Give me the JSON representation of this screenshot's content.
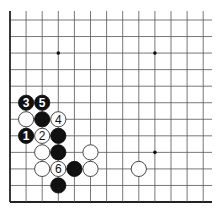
{
  "diagram": {
    "type": "go-board-fragment",
    "columns": 13,
    "rows": 12,
    "edges": [
      "left",
      "bottom"
    ],
    "star_points": [
      {
        "col": 3,
        "row": 2
      },
      {
        "col": 9,
        "row": 2
      },
      {
        "col": 9,
        "row": 8
      }
    ],
    "stones": [
      {
        "col": 1,
        "row": 5,
        "color": "black",
        "label": "3"
      },
      {
        "col": 2,
        "row": 5,
        "color": "black",
        "label": "5"
      },
      {
        "col": 1,
        "row": 6,
        "color": "white",
        "label": ""
      },
      {
        "col": 2,
        "row": 6,
        "color": "black",
        "label": ""
      },
      {
        "col": 3,
        "row": 6,
        "color": "white",
        "label": "4"
      },
      {
        "col": 1,
        "row": 7,
        "color": "black",
        "label": "1"
      },
      {
        "col": 2,
        "row": 7,
        "color": "white",
        "label": "2"
      },
      {
        "col": 3,
        "row": 7,
        "color": "black",
        "label": ""
      },
      {
        "col": 2,
        "row": 8,
        "color": "white",
        "label": ""
      },
      {
        "col": 3,
        "row": 8,
        "color": "black",
        "label": ""
      },
      {
        "col": 5,
        "row": 8,
        "color": "white",
        "label": ""
      },
      {
        "col": 2,
        "row": 9,
        "color": "white",
        "label": ""
      },
      {
        "col": 3,
        "row": 9,
        "color": "white",
        "label": "6"
      },
      {
        "col": 4,
        "row": 9,
        "color": "black",
        "label": ""
      },
      {
        "col": 5,
        "row": 9,
        "color": "white",
        "label": ""
      },
      {
        "col": 8,
        "row": 9,
        "color": "white",
        "label": ""
      },
      {
        "col": 3,
        "row": 10,
        "color": "black",
        "label": ""
      }
    ],
    "colors": {
      "line": "#555555",
      "edge": "#222222",
      "black_stone": "#111111",
      "white_stone": "#ffffff",
      "stone_outline": "#333333"
    }
  }
}
